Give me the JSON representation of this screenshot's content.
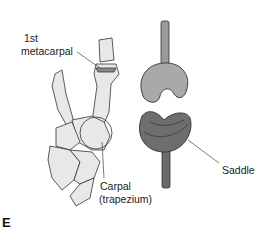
{
  "figure": {
    "panel_letter": "E",
    "labels": {
      "metacarpal_line1": "1st",
      "metacarpal_line2": "metacarpal",
      "carpal_line1": "Carpal",
      "carpal_line2": "(trapezium)",
      "saddle": "Saddle"
    },
    "colors": {
      "background": "#ffffff",
      "bone_fill": "#e6e6e6",
      "outline": "#333333",
      "upper_saddle": "#a9a9a9",
      "lower_saddle": "#6e6e6e",
      "rod_upper": "#9a9a9a",
      "rod_lower": "#6a6a6a"
    }
  }
}
